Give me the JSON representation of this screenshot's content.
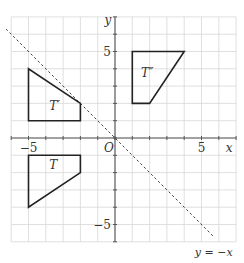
{
  "diagram": {
    "origin_px": [
      115,
      138
    ],
    "unit_px": 17.3,
    "grid": {
      "xmin": -6,
      "xmax": 7,
      "ymin": -6,
      "ymax": 7,
      "color": "#d8d8d8"
    },
    "axes": {
      "color": "#555555",
      "x_label": "x",
      "y_label": "y",
      "origin_label": "O"
    },
    "ticks": {
      "x": [
        {
          "value": -5,
          "label": "−5"
        },
        {
          "value": 5,
          "label": "5"
        }
      ],
      "y": [
        {
          "value": 5,
          "label": "5"
        },
        {
          "value": -5,
          "label": "−5"
        }
      ]
    },
    "mirror_line": {
      "label": "y = −x",
      "style": "dashed",
      "color": "#444444"
    },
    "shapes": [
      {
        "name": "T",
        "label": "T",
        "points": [
          [
            -5,
            -1
          ],
          [
            -2,
            -1
          ],
          [
            -2,
            -2
          ],
          [
            -5,
            -4
          ]
        ],
        "label_pos": [
          -3.8,
          -1.8
        ]
      },
      {
        "name": "T-prime",
        "label": "T′",
        "points": [
          [
            -5,
            4
          ],
          [
            -5,
            1
          ],
          [
            -2,
            1
          ],
          [
            -2,
            2
          ]
        ],
        "label_pos": [
          -3.8,
          1.6
        ]
      },
      {
        "name": "T-double-prime",
        "label": "T″",
        "points": [
          [
            1,
            5
          ],
          [
            4,
            5
          ],
          [
            2,
            2
          ],
          [
            1,
            2
          ]
        ],
        "label_pos": [
          1.5,
          3.5
        ]
      }
    ]
  }
}
